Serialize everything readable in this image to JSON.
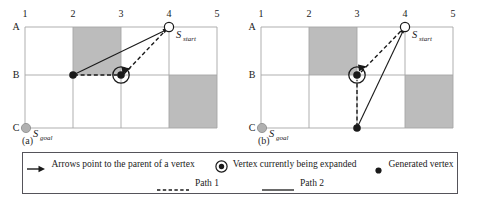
{
  "figure": {
    "columns": [
      "1",
      "2",
      "3",
      "4",
      "5"
    ],
    "rows": [
      "A",
      "B",
      "C"
    ],
    "panels": [
      {
        "caption": "(a)",
        "start_label": "S",
        "start_sub": "start",
        "goal_label": "S",
        "goal_sub": "goal",
        "row_label_c": "C",
        "obstacles": [
          {
            "col_start": 2,
            "col_end": 3,
            "row_start": "A",
            "row_end": "B"
          },
          {
            "col_start": 4,
            "col_end": 5,
            "row_start": "B",
            "row_end": "C"
          }
        ],
        "vertices": [
          {
            "type": "start-open",
            "col": 4,
            "row": "A"
          },
          {
            "type": "generated",
            "col": 2,
            "row": "B"
          },
          {
            "type": "expanded",
            "col": 3,
            "row": "B"
          },
          {
            "type": "goal",
            "col": 1,
            "row": "C"
          }
        ],
        "edges": [
          {
            "style": "path2-solid",
            "from_col": 2,
            "from_row": "B",
            "to_col": 4,
            "to_row": "A"
          },
          {
            "style": "path1-dashed",
            "from_col": 2,
            "from_row": "B",
            "to_col": 3,
            "to_row": "B"
          },
          {
            "style": "path1-dashed",
            "from_col": 3,
            "from_row": "B",
            "to_col": 4,
            "to_row": "A"
          }
        ]
      },
      {
        "caption": "(b)",
        "start_label": "S",
        "start_sub": "start",
        "goal_label": "S",
        "goal_sub": "goal",
        "row_label_c": "C",
        "obstacles": [
          {
            "col_start": 2,
            "col_end": 3,
            "row_start": "A",
            "row_end": "B"
          },
          {
            "col_start": 4,
            "col_end": 5,
            "row_start": "B",
            "row_end": "C"
          }
        ],
        "vertices": [
          {
            "type": "start-open",
            "col": 4,
            "row": "A"
          },
          {
            "type": "expanded",
            "col": 3,
            "row": "B"
          },
          {
            "type": "generated",
            "col": 3,
            "row": "C"
          },
          {
            "type": "goal",
            "col": 1,
            "row": "C"
          }
        ],
        "edges": [
          {
            "style": "path2-solid",
            "from_col": 3,
            "from_row": "C",
            "to_col": 4,
            "to_row": "A"
          },
          {
            "style": "path1-dashed",
            "from_col": 3,
            "from_row": "C",
            "to_col": 3,
            "to_row": "B"
          },
          {
            "style": "path1-dashed",
            "from_col": 3,
            "from_row": "B",
            "to_col": 4,
            "to_row": "A"
          }
        ]
      }
    ]
  },
  "legend": {
    "row1": [
      {
        "symbol": "arrow-icon",
        "label": "Arrows point to the parent of a vertex"
      },
      {
        "symbol": "expanded-vertex-icon",
        "label": "Vertex currently being expanded"
      },
      {
        "symbol": "generated-vertex-icon",
        "label": "Generated vertex"
      }
    ],
    "row2": [
      {
        "symbol": "dashed-line-icon",
        "label": "Path 1"
      },
      {
        "symbol": "solid-line-icon",
        "label": "Path 2"
      }
    ]
  },
  "colors": {
    "obstacle_fill": "#bcbcbc",
    "grid_line": "#a6a6a6",
    "ink": "#1a1a1a",
    "goal_fill": "#b0b0b0",
    "legend_border": "#55535a"
  }
}
